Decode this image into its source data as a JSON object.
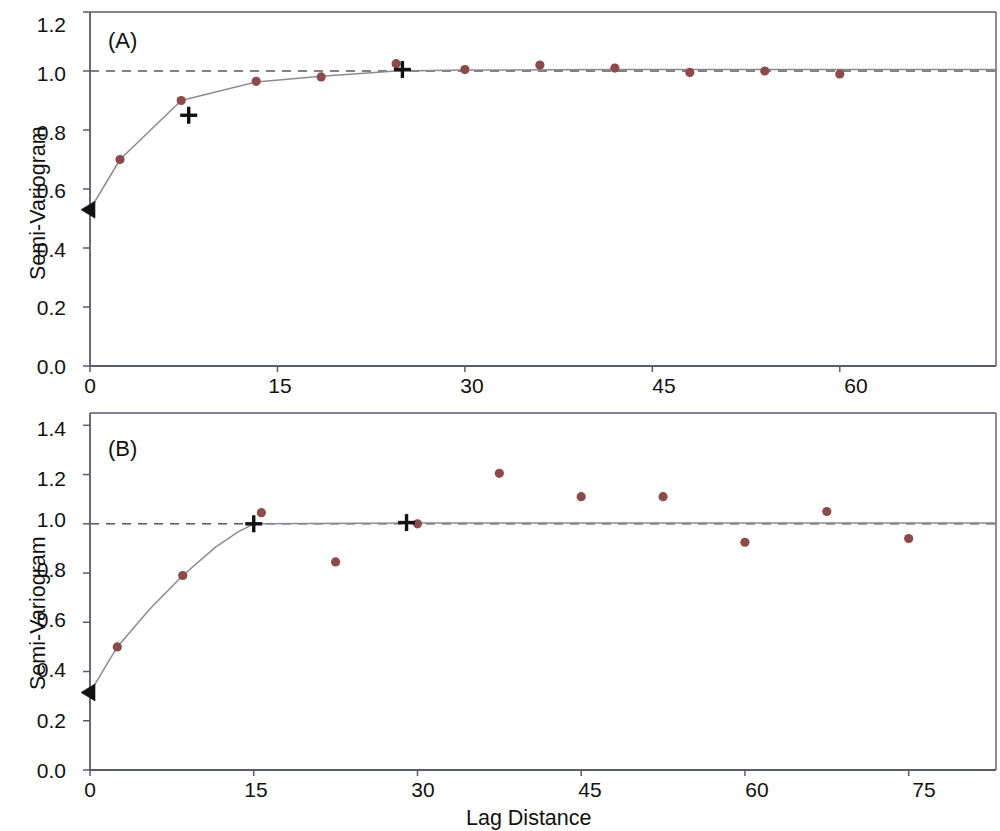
{
  "figure": {
    "background_color": "#ffffff",
    "point_color": "#8c4a4a",
    "line_color": "#8a8a92",
    "marker_color": "#111111",
    "axis_color": "#5a5a6e",
    "shared_xlabel": "Lag Distance",
    "shared_ylabel": "Semi-Variogram"
  },
  "chart_data": [
    {
      "type": "scatter",
      "panel": "A",
      "panel_label": "(A)",
      "title": "",
      "xlabel": "",
      "ylabel": "Semi-Variogram",
      "xlim": [
        0,
        72.5
      ],
      "ylim": [
        0.0,
        1.2
      ],
      "xticks": [
        0,
        15,
        30,
        45,
        60
      ],
      "xtick_labels": [
        "0",
        "15",
        "30",
        "45",
        "60"
      ],
      "yticks": [
        0.0,
        0.2,
        0.4,
        0.6,
        0.8,
        1.0,
        1.2
      ],
      "ytick_labels": [
        "0.0",
        "0.2",
        "0.4",
        "0.6",
        "0.8",
        "1.0",
        "1.2"
      ],
      "grid": false,
      "legend": "none",
      "sill_reference_line": 1.0,
      "sill_line_style": "dashed",
      "nugget_marker": {
        "symbol": "left-triangle",
        "x": 0,
        "y": 0.53
      },
      "cross_markers": [
        {
          "x": 7.9,
          "y": 0.85
        },
        {
          "x": 25.0,
          "y": 1.005
        }
      ],
      "series": [
        {
          "name": "empirical semi-variogram",
          "marker": "filled-circle",
          "points": [
            {
              "x": 0.0,
              "y": 0.53
            },
            {
              "x": 2.4,
              "y": 0.7
            },
            {
              "x": 7.3,
              "y": 0.9
            },
            {
              "x": 13.3,
              "y": 0.965
            },
            {
              "x": 18.5,
              "y": 0.98
            },
            {
              "x": 24.5,
              "y": 1.025
            },
            {
              "x": 30.0,
              "y": 1.005
            },
            {
              "x": 36.0,
              "y": 1.02
            },
            {
              "x": 42.0,
              "y": 1.01
            },
            {
              "x": 48.0,
              "y": 0.995
            },
            {
              "x": 54.0,
              "y": 1.0
            },
            {
              "x": 60.0,
              "y": 0.99
            }
          ]
        },
        {
          "name": "fitted model curve",
          "marker": "line",
          "points": [
            {
              "x": 0.0,
              "y": 0.53
            },
            {
              "x": 2.4,
              "y": 0.7
            },
            {
              "x": 7.3,
              "y": 0.9
            },
            {
              "x": 13.3,
              "y": 0.963
            },
            {
              "x": 18.5,
              "y": 0.982
            },
            {
              "x": 24.5,
              "y": 1.0
            },
            {
              "x": 30.0,
              "y": 1.003
            },
            {
              "x": 42.0,
              "y": 1.005
            },
            {
              "x": 60.0,
              "y": 1.005
            },
            {
              "x": 72.5,
              "y": 1.005
            }
          ]
        }
      ]
    },
    {
      "type": "scatter",
      "panel": "B",
      "panel_label": "(B)",
      "title": "",
      "xlabel": "Lag Distance",
      "ylabel": "Semi-Variogram",
      "xlim": [
        0,
        83
      ],
      "ylim": [
        0.0,
        1.45
      ],
      "xticks": [
        0,
        15,
        30,
        45,
        60,
        75
      ],
      "xtick_labels": [
        "0",
        "15",
        "30",
        "45",
        "60",
        "75"
      ],
      "yticks": [
        0.0,
        0.2,
        0.4,
        0.6,
        0.8,
        1.0,
        1.2,
        1.4
      ],
      "ytick_labels": [
        "0.0",
        "0.2",
        "0.4",
        "0.6",
        "0.8",
        "1.0",
        "1.2",
        "1.4"
      ],
      "grid": false,
      "legend": "none",
      "sill_reference_line": 1.0,
      "sill_line_style": "dashed",
      "nugget_marker": {
        "symbol": "left-triangle",
        "x": 0,
        "y": 0.315
      },
      "cross_markers": [
        {
          "x": 15.0,
          "y": 1.0
        },
        {
          "x": 29.0,
          "y": 1.005
        }
      ],
      "series": [
        {
          "name": "empirical semi-variogram",
          "marker": "filled-circle",
          "points": [
            {
              "x": 0.0,
              "y": 0.315
            },
            {
              "x": 2.5,
              "y": 0.5
            },
            {
              "x": 8.5,
              "y": 0.79
            },
            {
              "x": 15.7,
              "y": 1.045
            },
            {
              "x": 22.5,
              "y": 0.845
            },
            {
              "x": 30.0,
              "y": 1.0
            },
            {
              "x": 37.5,
              "y": 1.205
            },
            {
              "x": 45.0,
              "y": 1.11
            },
            {
              "x": 52.5,
              "y": 1.11
            },
            {
              "x": 60.0,
              "y": 0.925
            },
            {
              "x": 67.5,
              "y": 1.05
            },
            {
              "x": 75.0,
              "y": 0.94
            }
          ]
        },
        {
          "name": "fitted model curve",
          "marker": "line",
          "points": [
            {
              "x": 0.0,
              "y": 0.315
            },
            {
              "x": 2.5,
              "y": 0.5
            },
            {
              "x": 5.5,
              "y": 0.655
            },
            {
              "x": 8.5,
              "y": 0.79
            },
            {
              "x": 11.5,
              "y": 0.905
            },
            {
              "x": 13.5,
              "y": 0.965
            },
            {
              "x": 15.0,
              "y": 1.0
            },
            {
              "x": 30.0,
              "y": 1.003
            },
            {
              "x": 55.0,
              "y": 1.003
            },
            {
              "x": 83.0,
              "y": 1.003
            }
          ]
        }
      ]
    }
  ]
}
